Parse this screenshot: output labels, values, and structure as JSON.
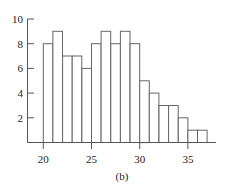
{
  "chart_data": {
    "type": "bar",
    "subtype": "histogram",
    "title": "",
    "caption": "(b)",
    "xlabel": "",
    "ylabel": "",
    "bin_width": 1,
    "bin_start": 20,
    "bins": [
      20,
      21,
      22,
      23,
      24,
      25,
      26,
      27,
      28,
      29,
      30,
      31,
      32,
      33,
      34,
      35,
      36
    ],
    "values": [
      8,
      9,
      7,
      7,
      6,
      8,
      9,
      8,
      9,
      8,
      5,
      4,
      3,
      3,
      2,
      1,
      1
    ],
    "xlim": [
      18.3,
      37.8
    ],
    "ylim": [
      0,
      10
    ],
    "x_ticks": [
      20,
      25,
      30,
      35
    ],
    "y_ticks": [
      2,
      4,
      6,
      8,
      10
    ],
    "grid": false,
    "legend": null
  }
}
